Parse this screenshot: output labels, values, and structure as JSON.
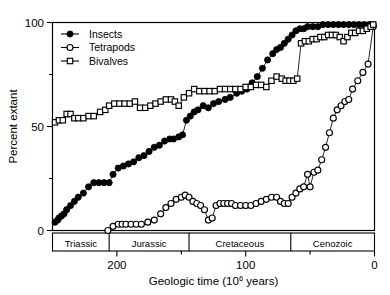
{
  "chart_data": {
    "type": "line",
    "title": "",
    "xlabel": "Geologic time (10^6 years)",
    "xlabel_main": "Geologic time (10",
    "xlabel_sup": "6",
    "xlabel_tail": " years)",
    "ylabel": "Percent extant",
    "xlim": [
      250,
      0
    ],
    "ylim": [
      0,
      100
    ],
    "x_reversed": true,
    "grid": false,
    "legend_position": "top-left",
    "x_major_ticks": [
      200,
      100,
      0
    ],
    "x_major_tick_labels": [
      "200",
      "100",
      "0"
    ],
    "x_minor_ticks": [
      150,
      50
    ],
    "y_major_ticks": [
      0,
      50,
      100
    ],
    "y_major_tick_labels": [
      "0",
      "50",
      "100"
    ],
    "y_minor_ticks": [
      25,
      75
    ],
    "periods": [
      {
        "name": "Triassic",
        "start": 250,
        "end": 206
      },
      {
        "name": "Jurassic",
        "start": 206,
        "end": 144
      },
      {
        "name": "Cretaceous",
        "start": 144,
        "end": 65
      },
      {
        "name": "Cenozoic",
        "start": 65,
        "end": 0
      }
    ],
    "series": [
      {
        "name": "Insects",
        "marker": "filled-circle",
        "points": [
          [
            248,
            4
          ],
          [
            246,
            5
          ],
          [
            245,
            6
          ],
          [
            243,
            7
          ],
          [
            241,
            8
          ],
          [
            239,
            10
          ],
          [
            236,
            12
          ],
          [
            233,
            14
          ],
          [
            230,
            16
          ],
          [
            226,
            18
          ],
          [
            222,
            21
          ],
          [
            218,
            23
          ],
          [
            214,
            23
          ],
          [
            210,
            23
          ],
          [
            206,
            23
          ],
          [
            203,
            27
          ],
          [
            199,
            30
          ],
          [
            195,
            31
          ],
          [
            191,
            32
          ],
          [
            187,
            33
          ],
          [
            183,
            35
          ],
          [
            179,
            36
          ],
          [
            175,
            38
          ],
          [
            171,
            40
          ],
          [
            167,
            41
          ],
          [
            163,
            43
          ],
          [
            159,
            44
          ],
          [
            156,
            44
          ],
          [
            152,
            45
          ],
          [
            149,
            46
          ],
          [
            146,
            53
          ],
          [
            143,
            55
          ],
          [
            140,
            57
          ],
          [
            137,
            58
          ],
          [
            133,
            60
          ],
          [
            129,
            59
          ],
          [
            125,
            61
          ],
          [
            121,
            62
          ],
          [
            116,
            63
          ],
          [
            112,
            64
          ],
          [
            107,
            66
          ],
          [
            103,
            67
          ],
          [
            99,
            68
          ],
          [
            95,
            71
          ],
          [
            91,
            74
          ],
          [
            87,
            78
          ],
          [
            83,
            82
          ],
          [
            79,
            85
          ],
          [
            76,
            87
          ],
          [
            73,
            88
          ],
          [
            70,
            90
          ],
          [
            67,
            92
          ],
          [
            64,
            94
          ],
          [
            61,
            96
          ],
          [
            58,
            97
          ],
          [
            55,
            97
          ],
          [
            52,
            98
          ],
          [
            48,
            98
          ],
          [
            44,
            98
          ],
          [
            40,
            99
          ],
          [
            36,
            99
          ],
          [
            32,
            99
          ],
          [
            28,
            99
          ],
          [
            24,
            99
          ],
          [
            20,
            99
          ],
          [
            16,
            99
          ],
          [
            12,
            99
          ],
          [
            8,
            99
          ],
          [
            4,
            99
          ],
          [
            1,
            99
          ]
        ]
      },
      {
        "name": "Tetrapods",
        "marker": "open-circle",
        "points": [
          [
            207,
            0
          ],
          [
            203,
            2
          ],
          [
            199,
            3
          ],
          [
            196,
            3
          ],
          [
            193,
            3
          ],
          [
            189,
            3
          ],
          [
            185,
            3
          ],
          [
            181,
            3
          ],
          [
            176,
            4
          ],
          [
            171,
            5
          ],
          [
            166,
            8
          ],
          [
            162,
            11
          ],
          [
            158,
            13
          ],
          [
            154,
            15
          ],
          [
            150,
            16
          ],
          [
            147,
            17
          ],
          [
            144,
            16
          ],
          [
            141,
            14
          ],
          [
            138,
            13
          ],
          [
            135,
            12
          ],
          [
            132,
            10
          ],
          [
            129,
            5
          ],
          [
            126,
            6
          ],
          [
            123,
            12
          ],
          [
            120,
            13
          ],
          [
            117,
            13
          ],
          [
            114,
            13
          ],
          [
            111,
            13
          ],
          [
            108,
            12
          ],
          [
            104,
            12
          ],
          [
            100,
            12
          ],
          [
            96,
            12
          ],
          [
            92,
            13
          ],
          [
            88,
            14
          ],
          [
            84,
            15
          ],
          [
            80,
            16
          ],
          [
            76,
            16
          ],
          [
            73,
            14
          ],
          [
            70,
            13
          ],
          [
            67,
            13
          ],
          [
            64,
            16
          ],
          [
            61,
            18
          ],
          [
            58,
            20
          ],
          [
            55,
            21
          ],
          [
            52,
            27
          ],
          [
            50,
            21
          ],
          [
            47,
            28
          ],
          [
            44,
            29
          ],
          [
            41,
            34
          ],
          [
            38,
            40
          ],
          [
            35,
            47
          ],
          [
            32,
            54
          ],
          [
            29,
            58
          ],
          [
            26,
            60
          ],
          [
            23,
            62
          ],
          [
            20,
            63
          ],
          [
            17,
            68
          ],
          [
            13,
            72
          ],
          [
            9,
            76
          ],
          [
            5,
            80
          ],
          [
            1,
            98
          ]
        ]
      },
      {
        "name": "Bivalves",
        "marker": "open-square",
        "points": [
          [
            248,
            52
          ],
          [
            245,
            53
          ],
          [
            242,
            53
          ],
          [
            239,
            56
          ],
          [
            236,
            56
          ],
          [
            233,
            54
          ],
          [
            230,
            54
          ],
          [
            226,
            54
          ],
          [
            222,
            55
          ],
          [
            218,
            55
          ],
          [
            213,
            57
          ],
          [
            209,
            58
          ],
          [
            206,
            60
          ],
          [
            202,
            61
          ],
          [
            198,
            61
          ],
          [
            194,
            61
          ],
          [
            190,
            61
          ],
          [
            186,
            62
          ],
          [
            182,
            59
          ],
          [
            178,
            59
          ],
          [
            174,
            60
          ],
          [
            170,
            61
          ],
          [
            166,
            62
          ],
          [
            162,
            63
          ],
          [
            158,
            63
          ],
          [
            155,
            62
          ],
          [
            152,
            60
          ],
          [
            148,
            64
          ],
          [
            144,
            66
          ],
          [
            140,
            68
          ],
          [
            136,
            67
          ],
          [
            132,
            67
          ],
          [
            128,
            67
          ],
          [
            124,
            67
          ],
          [
            120,
            68
          ],
          [
            116,
            68
          ],
          [
            112,
            68
          ],
          [
            108,
            68
          ],
          [
            104,
            68
          ],
          [
            100,
            69
          ],
          [
            96,
            69
          ],
          [
            92,
            70
          ],
          [
            88,
            70
          ],
          [
            84,
            69
          ],
          [
            80,
            72
          ],
          [
            76,
            74
          ],
          [
            72,
            73
          ],
          [
            69,
            72
          ],
          [
            66,
            72
          ],
          [
            63,
            72
          ],
          [
            60,
            73
          ],
          [
            57,
            90
          ],
          [
            54,
            91
          ],
          [
            51,
            91
          ],
          [
            48,
            92
          ],
          [
            45,
            92
          ],
          [
            42,
            93
          ],
          [
            39,
            93
          ],
          [
            36,
            94
          ],
          [
            33,
            94
          ],
          [
            30,
            94
          ],
          [
            27,
            93
          ],
          [
            24,
            91
          ],
          [
            21,
            93
          ],
          [
            18,
            95
          ],
          [
            15,
            95
          ],
          [
            12,
            96
          ],
          [
            9,
            96
          ],
          [
            6,
            97
          ],
          [
            3,
            98
          ],
          [
            1,
            99
          ]
        ]
      }
    ]
  },
  "legend": {
    "items": [
      {
        "label": "Insects",
        "marker": "filled-circle"
      },
      {
        "label": "Tetrapods",
        "marker": "open-circle"
      },
      {
        "label": "Bivalves",
        "marker": "open-square"
      }
    ]
  }
}
